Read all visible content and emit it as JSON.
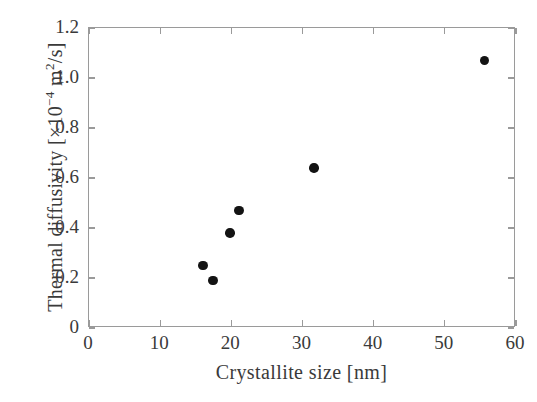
{
  "chart_data": {
    "type": "scatter",
    "title": "",
    "xlabel": "Crystallite size [nm]",
    "ylabel_parts": {
      "prefix": "Thermal diffusivity  [×10",
      "exponent": "−4",
      "suffix": " m",
      "unit_exponent": "2",
      "tail": "/s]"
    },
    "ylabel": "Thermal diffusivity [×10⁻⁴ m²/s]",
    "xlim": [
      0,
      60
    ],
    "ylim": [
      0,
      1.2
    ],
    "xticks": [
      "0",
      "10",
      "20",
      "30",
      "40",
      "50",
      "60"
    ],
    "xtick_values": [
      0,
      10,
      20,
      30,
      40,
      50,
      60
    ],
    "yticks": [
      "0",
      "0.2",
      "0.4",
      "0.6",
      "0.8",
      "1.0",
      "1.2"
    ],
    "ytick_values": [
      0,
      0.2,
      0.4,
      0.6,
      0.8,
      1.0,
      1.2
    ],
    "grid": false,
    "legend": null,
    "marker": {
      "shape": "circle",
      "filled": true,
      "color": "#131313",
      "size_px": 9.5
    },
    "axis_color": "#9a9a9a",
    "background": "#ffffff",
    "series": [
      {
        "name": "Thermal diffusivity vs crystallite size",
        "points": [
          {
            "x": 16.0,
            "y": 0.25
          },
          {
            "x": 17.4,
            "y": 0.19
          },
          {
            "x": 19.8,
            "y": 0.38
          },
          {
            "x": 21.1,
            "y": 0.47
          },
          {
            "x": 31.6,
            "y": 0.64
          },
          {
            "x": 55.6,
            "y": 1.07
          }
        ]
      }
    ]
  }
}
